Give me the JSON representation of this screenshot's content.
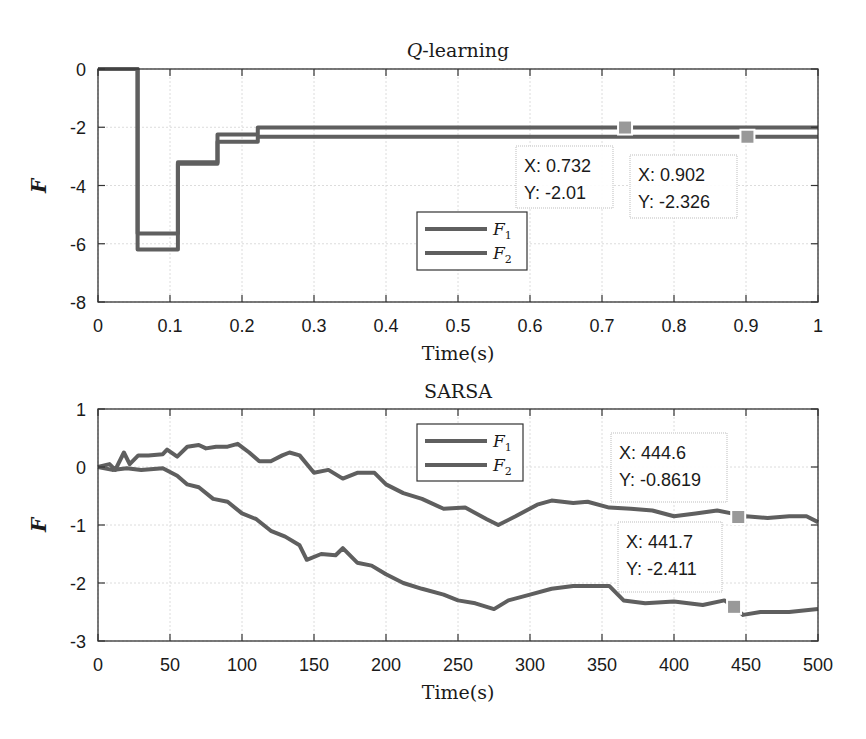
{
  "colors": {
    "line": "#5f5f5f",
    "axis": "#333333",
    "grid": "#dcdcdc",
    "marker": "#999999",
    "tip_border": "#bdbdbd"
  },
  "chart_data": [
    {
      "type": "line",
      "title": "Q-learning",
      "title_parts": {
        "italic": "Q",
        "rest": "-learning"
      },
      "xlabel": "Time(s)",
      "ylabel": "F",
      "xlim": [
        0,
        1
      ],
      "ylim": [
        -8,
        0
      ],
      "xticks": [
        0,
        0.1,
        0.2,
        0.3,
        0.4,
        0.5,
        0.6,
        0.7,
        0.8,
        0.9,
        1
      ],
      "xtick_labels": [
        "0",
        "0.1",
        "0.2",
        "0.3",
        "0.4",
        "0.5",
        "0.6",
        "0.7",
        "0.8",
        "0.9",
        "1"
      ],
      "yticks": [
        0,
        -2,
        -4,
        -6,
        -8
      ],
      "ytick_labels": [
        "0",
        "-2",
        "-4",
        "-6",
        "-8"
      ],
      "grid": true,
      "legend": {
        "position": "center",
        "entries": [
          {
            "label": "F",
            "sub": "1"
          },
          {
            "label": "F",
            "sub": "2"
          }
        ]
      },
      "series": [
        {
          "name": "F1",
          "step": true,
          "x": [
            0,
            0.055,
            0.055,
            0.111,
            0.111,
            0.166,
            0.166,
            0.222,
            0.222,
            1.0
          ],
          "y": [
            0,
            0,
            -5.65,
            -5.65,
            -3.25,
            -3.25,
            -2.25,
            -2.25,
            -2.01,
            -2.01
          ]
        },
        {
          "name": "F2",
          "step": true,
          "x": [
            0,
            0.055,
            0.055,
            0.111,
            0.111,
            0.166,
            0.166,
            0.222,
            0.222,
            1.0
          ],
          "y": [
            0,
            0,
            -6.2,
            -6.2,
            -3.2,
            -3.2,
            -2.5,
            -2.5,
            -2.326,
            -2.326
          ]
        }
      ],
      "datatips": [
        {
          "x": 0.732,
          "y": -2.01,
          "x_label": "X: 0.732",
          "y_label": "Y: -2.01"
        },
        {
          "x": 0.902,
          "y": -2.326,
          "x_label": "X: 0.902",
          "y_label": "Y: -2.326"
        }
      ]
    },
    {
      "type": "line",
      "title": "SARSA",
      "xlabel": "Time(s)",
      "ylabel": "F",
      "xlim": [
        0,
        500
      ],
      "ylim": [
        -3,
        1
      ],
      "xticks": [
        0,
        50,
        100,
        150,
        200,
        250,
        300,
        350,
        400,
        450,
        500
      ],
      "xtick_labels": [
        "0",
        "50",
        "100",
        "150",
        "200",
        "250",
        "300",
        "350",
        "400",
        "450",
        "500"
      ],
      "yticks": [
        1,
        0,
        -1,
        -2,
        -3
      ],
      "ytick_labels": [
        "1",
        "0",
        "-1",
        "-2",
        "-3"
      ],
      "grid": true,
      "legend": {
        "position": "north",
        "entries": [
          {
            "label": "F",
            "sub": "1"
          },
          {
            "label": "F",
            "sub": "2"
          }
        ]
      },
      "series": [
        {
          "name": "F1",
          "x": [
            0,
            8,
            12,
            18,
            22,
            28,
            35,
            45,
            48,
            55,
            62,
            70,
            75,
            82,
            90,
            97,
            105,
            112,
            120,
            128,
            133,
            140,
            150,
            160,
            170,
            180,
            192,
            200,
            212,
            225,
            240,
            255,
            270,
            278,
            290,
            305,
            315,
            330,
            340,
            355,
            370,
            385,
            400,
            415,
            430,
            440,
            444.6,
            450,
            465,
            480,
            492,
            500
          ],
          "y": [
            0,
            0.05,
            -0.05,
            0.25,
            0.05,
            0.2,
            0.2,
            0.22,
            0.3,
            0.18,
            0.35,
            0.38,
            0.32,
            0.35,
            0.35,
            0.4,
            0.25,
            0.1,
            0.1,
            0.2,
            0.25,
            0.2,
            -0.1,
            -0.05,
            -0.2,
            -0.1,
            -0.1,
            -0.3,
            -0.45,
            -0.55,
            -0.72,
            -0.7,
            -0.9,
            -1.0,
            -0.85,
            -0.65,
            -0.58,
            -0.62,
            -0.6,
            -0.7,
            -0.72,
            -0.75,
            -0.85,
            -0.8,
            -0.75,
            -0.8,
            -0.8619,
            -0.85,
            -0.88,
            -0.85,
            -0.85,
            -0.95
          ]
        },
        {
          "name": "F2",
          "x": [
            0,
            10,
            20,
            30,
            45,
            55,
            62,
            70,
            80,
            90,
            100,
            110,
            120,
            130,
            140,
            145,
            155,
            165,
            170,
            180,
            190,
            200,
            212,
            225,
            240,
            250,
            262,
            275,
            285,
            300,
            315,
            330,
            345,
            355,
            365,
            380,
            400,
            420,
            435,
            441.7,
            448,
            460,
            480,
            500
          ],
          "y": [
            0,
            -0.05,
            -0.02,
            -0.05,
            -0.02,
            -0.15,
            -0.3,
            -0.35,
            -0.55,
            -0.6,
            -0.8,
            -0.9,
            -1.1,
            -1.2,
            -1.35,
            -1.6,
            -1.5,
            -1.52,
            -1.4,
            -1.65,
            -1.7,
            -1.85,
            -2.0,
            -2.1,
            -2.2,
            -2.3,
            -2.35,
            -2.45,
            -2.3,
            -2.2,
            -2.1,
            -2.05,
            -2.05,
            -2.05,
            -2.3,
            -2.35,
            -2.32,
            -2.38,
            -2.3,
            -2.411,
            -2.55,
            -2.5,
            -2.5,
            -2.45
          ]
        }
      ],
      "datatips": [
        {
          "x": 444.6,
          "y": -0.8619,
          "x_label": "X: 444.6",
          "y_label": "Y: -0.8619"
        },
        {
          "x": 441.7,
          "y": -2.411,
          "x_label": "X: 441.7",
          "y_label": "Y: -2.411"
        }
      ]
    }
  ]
}
